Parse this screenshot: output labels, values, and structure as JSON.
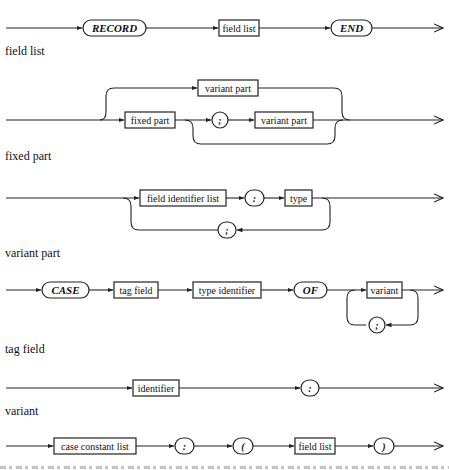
{
  "diagrams": [
    {
      "name": "record type",
      "elements": [
        {
          "kind": "terminal",
          "text": "RECORD"
        },
        {
          "kind": "nonterminal",
          "text": "field list"
        },
        {
          "kind": "terminal",
          "text": "END"
        }
      ]
    },
    {
      "name": "field list",
      "label": "field list",
      "elements": [
        {
          "kind": "nonterminal",
          "text": "variant part"
        },
        {
          "kind": "nonterminal",
          "text": "fixed part"
        },
        {
          "kind": "terminal",
          "text": ";"
        },
        {
          "kind": "nonterminal",
          "text": "variant part"
        }
      ]
    },
    {
      "name": "fixed part",
      "label": "fixed part",
      "elements": [
        {
          "kind": "nonterminal",
          "text": "field identifier list"
        },
        {
          "kind": "terminal",
          "text": ":"
        },
        {
          "kind": "nonterminal",
          "text": "type"
        },
        {
          "kind": "terminal",
          "text": ";"
        }
      ]
    },
    {
      "name": "variant part",
      "label": "variant part",
      "elements": [
        {
          "kind": "terminal",
          "text": "CASE"
        },
        {
          "kind": "nonterminal",
          "text": "tag field"
        },
        {
          "kind": "nonterminal",
          "text": "type identifier"
        },
        {
          "kind": "terminal",
          "text": "OF"
        },
        {
          "kind": "nonterminal",
          "text": "variant"
        },
        {
          "kind": "terminal",
          "text": ";"
        }
      ]
    },
    {
      "name": "tag field",
      "label": "tag field",
      "elements": [
        {
          "kind": "nonterminal",
          "text": "identifier"
        },
        {
          "kind": "terminal",
          "text": ":"
        }
      ]
    },
    {
      "name": "variant",
      "label": "variant",
      "elements": [
        {
          "kind": "nonterminal",
          "text": "case constant list"
        },
        {
          "kind": "terminal",
          "text": ":"
        },
        {
          "kind": "terminal",
          "text": "("
        },
        {
          "kind": "nonterminal",
          "text": "field list"
        },
        {
          "kind": "terminal",
          "text": ")"
        }
      ]
    }
  ]
}
